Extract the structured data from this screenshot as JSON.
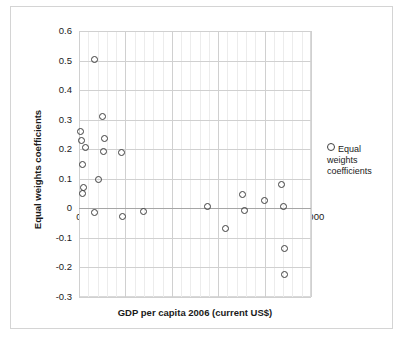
{
  "chart_data": {
    "type": "scatter",
    "title": "",
    "xlabel": "GDP per capita 2006 (current US$)",
    "ylabel": "Equal weights coefficients",
    "xlim": [
      0,
      50000
    ],
    "ylim": [
      -0.3,
      0.6
    ],
    "xticks": [
      0,
      10000,
      20000,
      30000,
      40000,
      50000
    ],
    "xtick_labels": [
      "0",
      "10000",
      "20000",
      "30000",
      "40000",
      "50000"
    ],
    "yticks": [
      -0.3,
      -0.2,
      -0.1,
      0,
      0.1,
      0.2,
      0.3,
      0.4,
      0.5,
      0.6
    ],
    "ytick_labels": [
      "-0.3",
      "-0.2",
      "-0.1",
      "0",
      "0.1",
      "0.2",
      "0.3",
      "0.4",
      "0.5",
      "0.6"
    ],
    "grid": "major horizontal and major+minor vertical",
    "legend_position": "right",
    "series": [
      {
        "name": "Equal weights coefficients",
        "marker": "open-circle",
        "color": "#3f3f3f",
        "points": [
          [
            3300,
            0.504
          ],
          [
            5000,
            0.312
          ],
          [
            250,
            0.261
          ],
          [
            600,
            0.229
          ],
          [
            1400,
            0.205
          ],
          [
            5500,
            0.236
          ],
          [
            5200,
            0.191
          ],
          [
            9200,
            0.19
          ],
          [
            700,
            0.147
          ],
          [
            4100,
            0.097
          ],
          [
            900,
            0.069
          ],
          [
            700,
            0.05
          ],
          [
            3400,
            -0.013
          ],
          [
            9300,
            -0.028
          ],
          [
            14000,
            -0.011
          ],
          [
            27800,
            0.006
          ],
          [
            31500,
            -0.068
          ],
          [
            35300,
            0.047
          ],
          [
            35600,
            -0.008
          ],
          [
            40000,
            0.027
          ],
          [
            43600,
            0.079
          ],
          [
            44000,
            0.006
          ],
          [
            44200,
            -0.137
          ],
          [
            44300,
            -0.225
          ]
        ]
      }
    ]
  },
  "legend": {
    "entries": [
      {
        "label": "Equal weights coefficients",
        "marker": "open-circle"
      }
    ]
  },
  "icons": {
    "legend_marker": "open-circle-icon"
  }
}
